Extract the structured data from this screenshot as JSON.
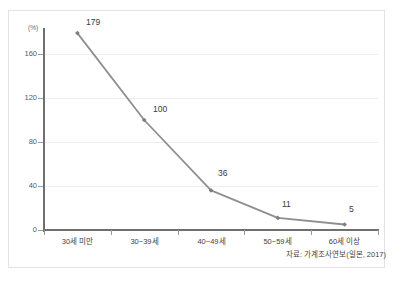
{
  "chart_data": {
    "type": "line",
    "title": "",
    "xlabel": "",
    "ylabel": "(%)",
    "categories": [
      "30세 미만",
      "30~39세",
      "40~49세",
      "50~59세",
      "60세 이상"
    ],
    "values": [
      179,
      100,
      36,
      11,
      5
    ],
    "point_labels": [
      "179",
      "100",
      "36",
      "11",
      "5"
    ],
    "ylim": [
      0,
      180
    ],
    "yticks": [
      0,
      40,
      80,
      120,
      160
    ],
    "ytick_labels": [
      "0",
      "40",
      "80",
      "120",
      "160"
    ],
    "grid": "horizontal",
    "legend": "none",
    "series_color": "#8f8f92",
    "marker": "diamond",
    "source_note": "자료: 가계조사연보(일본, 2017)"
  },
  "figure": {
    "unit_label": "(%)",
    "faint_top_title": "",
    "frame_color": "#e3e3e6",
    "axis_color": "#6f6f72",
    "grid_color": "#eeeef1",
    "background": "#ffffff"
  }
}
